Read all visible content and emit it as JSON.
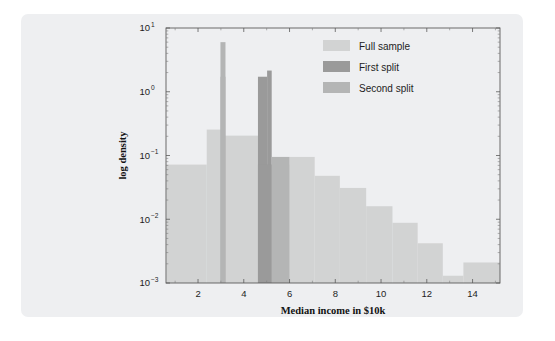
{
  "figure": {
    "background_color": "#eeeff1",
    "page_background": "#ffffff"
  },
  "chart_data": {
    "type": "bar",
    "title": "",
    "subtitle": "",
    "xlabel": "Median income in $10k",
    "ylabel": "log density",
    "xlim": [
      0.6,
      15.2
    ],
    "ylim": [
      0.001,
      10
    ],
    "yscale": "log",
    "xscale": "linear",
    "grid": false,
    "legend_position": "top-right",
    "xticks": [
      2,
      4,
      6,
      8,
      10,
      12,
      14
    ],
    "xtick_labels": [
      "2",
      "4",
      "6",
      "8",
      "10",
      "12",
      "14"
    ],
    "yticks": [
      0.001,
      0.01,
      0.1,
      1,
      10
    ],
    "ytick_labels": [
      "10⁻³",
      "10⁻²",
      "10⁻¹",
      "10⁰",
      "10¹"
    ],
    "ytick_mantissas": [
      "10",
      "10",
      "10",
      "10",
      "10"
    ],
    "ytick_exponents": [
      "-3",
      "-2",
      "-1",
      "0",
      "1"
    ],
    "series": [
      {
        "name": "Full sample",
        "color": "#d2d3d3",
        "bars": [
          {
            "x0": 0.62,
            "x1": 2.38,
            "value": 0.072
          },
          {
            "x0": 2.38,
            "x1": 3.12,
            "value": 0.255
          },
          {
            "x0": 3.12,
            "x1": 4.85,
            "value": 0.205
          },
          {
            "x0": 4.85,
            "x1": 6.0,
            "value": 0.072
          },
          {
            "x0": 6.0,
            "x1": 7.1,
            "value": 0.095
          },
          {
            "x0": 7.1,
            "x1": 8.2,
            "value": 0.048
          },
          {
            "x0": 8.2,
            "x1": 9.35,
            "value": 0.031
          },
          {
            "x0": 9.35,
            "x1": 10.5,
            "value": 0.016
          },
          {
            "x0": 10.5,
            "x1": 11.6,
            "value": 0.0088
          },
          {
            "x0": 11.6,
            "x1": 12.7,
            "value": 0.0042
          },
          {
            "x0": 12.7,
            "x1": 13.6,
            "value": 0.0013
          },
          {
            "x0": 13.6,
            "x1": 15.2,
            "value": 0.0021
          }
        ]
      },
      {
        "name": "First split",
        "color": "#9a9a9a",
        "bars": [
          {
            "x0": 4.62,
            "x1": 5.02,
            "value": 1.72
          },
          {
            "x0": 5.02,
            "x1": 5.22,
            "value": 2.15
          },
          {
            "x0": 4.62,
            "x1": 5.22,
            "value": 0.072
          }
        ]
      },
      {
        "name": "Second split",
        "color": "#b4b5b5",
        "bars": [
          {
            "x0": 2.98,
            "x1": 3.2,
            "value": 6.0
          },
          {
            "x0": 2.98,
            "x1": 3.2,
            "value": 1.72
          },
          {
            "x0": 5.22,
            "x1": 6.0,
            "value": 0.095
          }
        ]
      }
    ],
    "annotations": [
      {
        "text": "thin spike near x=3 reaching 6",
        "x": 3.05,
        "y": 6.0
      },
      {
        "text": "dark peak near x=5 reaching 2.15",
        "x": 5.1,
        "y": 2.15
      }
    ]
  },
  "legend": {
    "entries": [
      {
        "label": "Full sample",
        "color": "#d2d3d3"
      },
      {
        "label": "First split",
        "color": "#9a9a9a"
      },
      {
        "label": "Second split",
        "color": "#b4b5b5"
      }
    ]
  },
  "axes": {
    "x_title": "Median income in $10k",
    "y_title": "log density"
  }
}
